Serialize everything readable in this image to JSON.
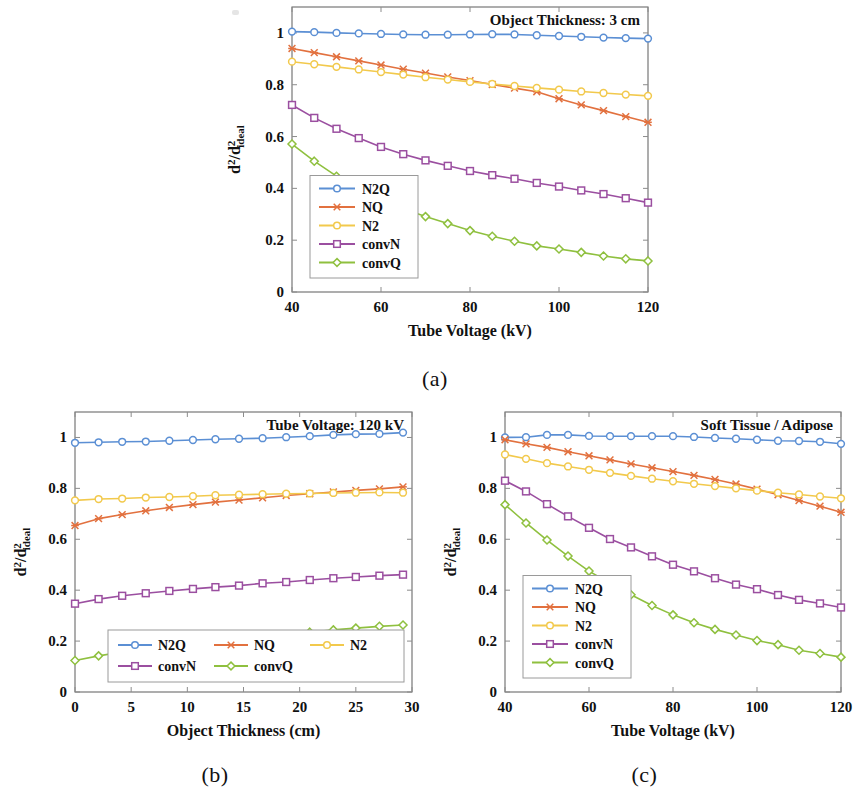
{
  "figure": {
    "panels": [
      {
        "id": "a",
        "sublabel": "(a)",
        "corner_title": "Object Thickness: 3 cm",
        "legend_layout": "vertical",
        "chart_data": {
          "type": "line",
          "title": "Object Thickness: 3 cm",
          "xlabel": "Tube Voltage (kV)",
          "ylabel": "d²/d²ideal",
          "xlim": [
            40,
            120
          ],
          "ylim": [
            0,
            1.1
          ],
          "xticks": [
            40,
            60,
            80,
            100,
            120
          ],
          "xtick_labels": [
            "40",
            "60",
            "80",
            "100",
            "120"
          ],
          "yticks": [
            0,
            0.2,
            0.4,
            0.6,
            0.8,
            1
          ],
          "ytick_labels": [
            "0",
            "0.2",
            "0.4",
            "0.6",
            "0.8",
            "1"
          ],
          "grid": false,
          "legend_position": "lower-left",
          "x": [
            40,
            45,
            50,
            55,
            60,
            65,
            70,
            75,
            80,
            85,
            90,
            95,
            100,
            105,
            110,
            115,
            120
          ],
          "series": [
            {
              "name": "N2Q",
              "marker": "circle",
              "color": "#5b8fd4",
              "values": [
                1.005,
                1.003,
                1.0,
                0.998,
                0.996,
                0.994,
                0.993,
                0.993,
                0.994,
                0.995,
                0.994,
                0.991,
                0.988,
                0.985,
                0.982,
                0.98,
                0.978
              ]
            },
            {
              "name": "NQ",
              "marker": "cross",
              "color": "#e2713f",
              "values": [
                0.94,
                0.924,
                0.908,
                0.892,
                0.876,
                0.86,
                0.845,
                0.83,
                0.816,
                0.801,
                0.787,
                0.773,
                0.746,
                0.722,
                0.7,
                0.677,
                0.655
              ]
            },
            {
              "name": "N2",
              "marker": "circle",
              "color": "#f2c94c",
              "values": [
                0.889,
                0.879,
                0.869,
                0.859,
                0.849,
                0.839,
                0.829,
                0.82,
                0.811,
                0.803,
                0.795,
                0.788,
                0.781,
                0.774,
                0.768,
                0.762,
                0.757
              ]
            },
            {
              "name": "convN",
              "marker": "square",
              "color": "#9b4fa0",
              "values": [
                0.722,
                0.672,
                0.63,
                0.594,
                0.56,
                0.532,
                0.508,
                0.487,
                0.467,
                0.451,
                0.437,
                0.421,
                0.407,
                0.392,
                0.378,
                0.362,
                0.345
              ]
            },
            {
              "name": "convQ",
              "marker": "diamond",
              "color": "#8fc03f",
              "values": [
                0.571,
                0.505,
                0.447,
                0.397,
                0.357,
                0.321,
                0.291,
                0.264,
                0.237,
                0.215,
                0.196,
                0.178,
                0.166,
                0.153,
                0.139,
                0.128,
                0.12
              ]
            }
          ]
        }
      },
      {
        "id": "b",
        "sublabel": "(b)",
        "corner_title": "Tube Voltage: 120 kV",
        "legend_layout": "grid3",
        "chart_data": {
          "type": "line",
          "title": "Tube Voltage: 120 kV",
          "xlabel": "Object Thickness (cm)",
          "ylabel": "d²/d²ideal",
          "xlim": [
            0,
            30
          ],
          "ylim": [
            0,
            1.1
          ],
          "xticks": [
            0,
            5,
            10,
            15,
            20,
            25,
            30
          ],
          "xtick_labels": [
            "0",
            "5",
            "10",
            "15",
            "20",
            "25",
            "30"
          ],
          "yticks": [
            0,
            0.2,
            0.4,
            0.6,
            0.8,
            1
          ],
          "ytick_labels": [
            "0",
            "0.2",
            "0.4",
            "0.6",
            "0.8",
            "1"
          ],
          "grid": false,
          "legend_position": "lower-right",
          "x": [
            0,
            2.1,
            4.2,
            6.3,
            8.4,
            10.5,
            12.5,
            14.6,
            16.7,
            18.8,
            20.9,
            23.0,
            25.0,
            27.1,
            29.2
          ],
          "series": [
            {
              "name": "N2Q",
              "marker": "circle",
              "color": "#5b8fd4",
              "values": [
                0.979,
                0.981,
                0.983,
                0.984,
                0.987,
                0.99,
                0.993,
                0.995,
                0.997,
                1.001,
                1.005,
                1.01,
                1.013,
                1.014,
                1.019
              ]
            },
            {
              "name": "NQ",
              "marker": "cross",
              "color": "#e2713f",
              "values": [
                0.654,
                0.681,
                0.697,
                0.712,
                0.725,
                0.736,
                0.746,
                0.754,
                0.763,
                0.772,
                0.779,
                0.786,
                0.792,
                0.798,
                0.806
              ]
            },
            {
              "name": "N2",
              "marker": "circle",
              "color": "#f2c94c",
              "values": [
                0.753,
                0.758,
                0.76,
                0.764,
                0.766,
                0.769,
                0.773,
                0.775,
                0.777,
                0.779,
                0.78,
                0.782,
                0.783,
                0.784,
                0.783
              ]
            },
            {
              "name": "convN",
              "marker": "square",
              "color": "#9b4fa0",
              "values": [
                0.347,
                0.365,
                0.378,
                0.388,
                0.397,
                0.405,
                0.412,
                0.418,
                0.427,
                0.432,
                0.44,
                0.447,
                0.452,
                0.457,
                0.461
              ]
            },
            {
              "name": "convQ",
              "marker": "diamond",
              "color": "#8fc03f",
              "values": [
                0.124,
                0.142,
                0.157,
                0.169,
                0.181,
                0.191,
                0.201,
                0.209,
                0.216,
                0.223,
                0.235,
                0.244,
                0.251,
                0.258,
                0.263
              ]
            }
          ]
        }
      },
      {
        "id": "c",
        "sublabel": "(c)",
        "corner_title": "Soft Tissue / Adipose",
        "legend_layout": "vertical",
        "chart_data": {
          "type": "line",
          "title": "Soft Tissue / Adipose",
          "xlabel": "Tube Voltage (kV)",
          "ylabel": "d²/d²ideal",
          "xlim": [
            40,
            120
          ],
          "ylim": [
            0,
            1.1
          ],
          "xticks": [
            40,
            60,
            80,
            100,
            120
          ],
          "xtick_labels": [
            "40",
            "60",
            "80",
            "100",
            "120"
          ],
          "yticks": [
            0,
            0.2,
            0.4,
            0.6,
            0.8,
            1
          ],
          "ytick_labels": [
            "0",
            "0.2",
            "0.4",
            "0.6",
            "0.8",
            "1"
          ],
          "grid": false,
          "legend_position": "lower-left",
          "x": [
            40,
            45,
            50,
            55,
            60,
            65,
            70,
            75,
            80,
            85,
            90,
            95,
            100,
            105,
            110,
            115,
            120
          ],
          "series": [
            {
              "name": "N2Q",
              "marker": "circle",
              "color": "#5b8fd4",
              "values": [
                1.0,
                1.001,
                1.01,
                1.01,
                1.006,
                1.005,
                1.005,
                1.005,
                1.005,
                1.002,
                0.998,
                0.995,
                0.991,
                0.987,
                0.986,
                0.983,
                0.975
              ]
            },
            {
              "name": "NQ",
              "marker": "cross",
              "color": "#e2713f",
              "values": [
                0.991,
                0.975,
                0.961,
                0.944,
                0.928,
                0.912,
                0.896,
                0.881,
                0.866,
                0.851,
                0.835,
                0.817,
                0.797,
                0.775,
                0.752,
                0.73,
                0.706
              ]
            },
            {
              "name": "N2",
              "marker": "circle",
              "color": "#f2c94c",
              "values": [
                0.933,
                0.916,
                0.899,
                0.886,
                0.873,
                0.861,
                0.849,
                0.838,
                0.828,
                0.818,
                0.809,
                0.8,
                0.791,
                0.783,
                0.776,
                0.768,
                0.761
              ]
            },
            {
              "name": "convN",
              "marker": "square",
              "color": "#9b4fa0",
              "values": [
                0.83,
                0.788,
                0.738,
                0.69,
                0.645,
                0.601,
                0.568,
                0.533,
                0.5,
                0.474,
                0.447,
                0.422,
                0.404,
                0.381,
                0.362,
                0.348,
                0.332
              ]
            },
            {
              "name": "convQ",
              "marker": "diamond",
              "color": "#8fc03f",
              "values": [
                0.736,
                0.664,
                0.597,
                0.534,
                0.475,
                0.427,
                0.382,
                0.34,
                0.303,
                0.272,
                0.246,
                0.224,
                0.202,
                0.186,
                0.164,
                0.151,
                0.137
              ]
            }
          ]
        }
      }
    ]
  }
}
